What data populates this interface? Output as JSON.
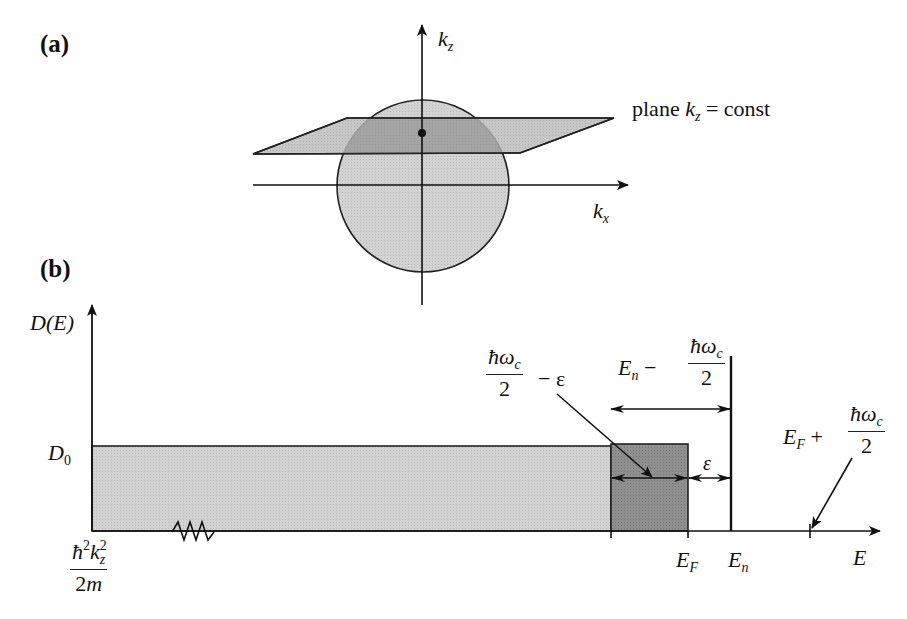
{
  "panels": [
    {
      "label": "(a)",
      "axes": {
        "vertical": "k",
        "vertical_sub": "z",
        "horizontal": "k",
        "horizontal_sub": "x"
      },
      "annotation": {
        "prefix": "plane ",
        "var": "k",
        "var_sub": "z",
        "suffix": " = const"
      },
      "shapes": [
        "sphere (Fermi sphere)",
        "plane k_z = const",
        "point at plane-axis intersection"
      ]
    },
    {
      "label": "(b)",
      "y_axis_label": {
        "main": "D(E)"
      },
      "x_axis_label": {
        "main": "E"
      },
      "y_tick": {
        "main": "D",
        "sub": "0"
      },
      "origin_label": {
        "num_hbar": "ħ",
        "num_sup1": "2",
        "num_k": "k",
        "num_sub": "z",
        "num_sup2": "2",
        "den": "2m"
      },
      "x_ticks": [
        {
          "main": "E",
          "sub": "F"
        },
        {
          "main": "E",
          "sub": "n"
        }
      ],
      "annotations": {
        "hw_minus_eps": {
          "num": "ħω",
          "num_sub": "c",
          "den": "2",
          "suffix": "− ε"
        },
        "en_minus_hw": {
          "prefix": "E",
          "prefix_sub": "n",
          "op": " − ",
          "num": "ħω",
          "num_sub": "c",
          "den": "2"
        },
        "epsilon": "ε",
        "ef_plus_hw": {
          "prefix": "E",
          "prefix_sub": "F",
          "op": " + ",
          "num": "ħω",
          "num_sub": "c",
          "den": "2"
        }
      },
      "colors": {
        "light_fill": "#c8c8c8",
        "dark_fill": "#8a8a8a",
        "line": "#1a1a1a"
      }
    }
  ]
}
